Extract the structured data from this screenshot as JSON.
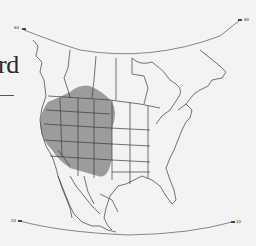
{
  "figure": {
    "title_fragment": "rd",
    "type": "range map",
    "region": "North America",
    "range_color": "#9a9a9a",
    "line_color": "#3a3a3a",
    "background": "#f3f3f1"
  },
  "latitude_labels": {
    "top_left": "60",
    "top_right": "60",
    "bottom_left": "20",
    "bottom_right": "20"
  },
  "shaded_range": {
    "description": "Western United States range",
    "states_covered": [
      "Washington (east)",
      "Oregon",
      "California",
      "Nevada",
      "Idaho",
      "Montana",
      "Wyoming",
      "Utah",
      "Colorado",
      "Arizona",
      "New Mexico"
    ]
  }
}
